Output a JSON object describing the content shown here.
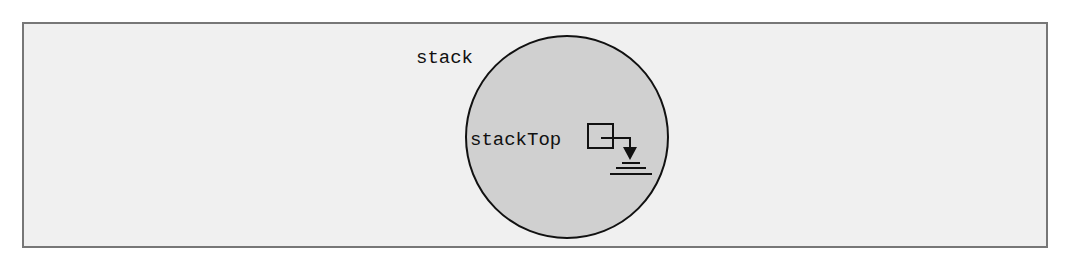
{
  "diagram": {
    "frame": {
      "background": "#f0f0f0",
      "border_color": "#777777"
    },
    "object": {
      "label": "stack",
      "shape": "circle",
      "fill": "#d0d0d0",
      "stroke": "#111111"
    },
    "field": {
      "label": "stackTop",
      "value": "null",
      "pointer_icon": "null-pointer-ground-icon"
    }
  }
}
